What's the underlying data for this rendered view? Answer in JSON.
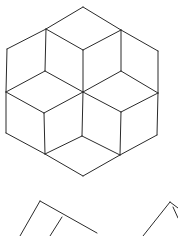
{
  "diagram": {
    "title": "",
    "stroke_color": "#2a2a2a",
    "background": "#ffffff",
    "hexagon": {
      "segments": [
        [
          83,
          7,
          121,
          30
        ],
        [
          121,
          30,
          158,
          51
        ],
        [
          158,
          51,
          158,
          93
        ],
        [
          158,
          93,
          157,
          135
        ],
        [
          157,
          135,
          120,
          155
        ],
        [
          120,
          155,
          83,
          176
        ],
        [
          83,
          176,
          45,
          154
        ],
        [
          45,
          154,
          6,
          133
        ],
        [
          6,
          133,
          6,
          92
        ],
        [
          6,
          92,
          7,
          49
        ],
        [
          7,
          49,
          46,
          29
        ],
        [
          46,
          29,
          83,
          7
        ],
        [
          46,
          29,
          83,
          50
        ],
        [
          83,
          50,
          121,
          30
        ],
        [
          46,
          29,
          45,
          71
        ],
        [
          121,
          30,
          121,
          71
        ],
        [
          83,
          50,
          83,
          92
        ],
        [
          45,
          71,
          83,
          92
        ],
        [
          121,
          71,
          83,
          92
        ],
        [
          45,
          71,
          6,
          92
        ],
        [
          121,
          71,
          158,
          93
        ],
        [
          6,
          92,
          44,
          113
        ],
        [
          44,
          113,
          83,
          92
        ],
        [
          83,
          92,
          121,
          112
        ],
        [
          121,
          112,
          158,
          93
        ],
        [
          44,
          113,
          45,
          154
        ],
        [
          121,
          112,
          120,
          155
        ],
        [
          83,
          92,
          82,
          136
        ],
        [
          82,
          136,
          45,
          154
        ],
        [
          82,
          136,
          120,
          155
        ]
      ]
    },
    "partial_figures": [
      {
        "name": "left-rhombus-partial",
        "segments": [
          [
            40,
            201,
            20,
            236
          ],
          [
            40,
            201,
            97,
            233
          ],
          [
            62,
            217,
            50,
            236
          ]
        ]
      },
      {
        "name": "right-rhombus-partial",
        "segments": [
          [
            170,
            202,
            143,
            236
          ],
          [
            170,
            202,
            178,
            208
          ],
          [
            173,
            207,
            178,
            218
          ]
        ]
      }
    ]
  }
}
